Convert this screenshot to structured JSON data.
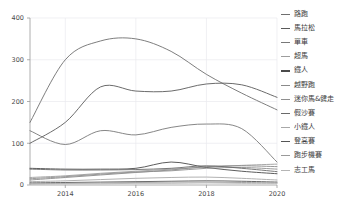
{
  "chart_data": {
    "type": "line",
    "title": "",
    "subtitle": "",
    "xlabel": "",
    "ylabel": "",
    "xlim": [
      2013,
      2020
    ],
    "ylim": [
      0,
      400
    ],
    "grid": true,
    "legend_position": "right",
    "x": [
      2013,
      2014,
      2015,
      2016,
      2017,
      2018,
      2019,
      2020
    ],
    "xticks": [
      "2014",
      "2016",
      "2018",
      "2020"
    ],
    "xtick_values": [
      2014,
      2016,
      2018,
      2020
    ],
    "yticks": [
      "0",
      "100",
      "200",
      "300",
      "400"
    ],
    "ytick_values": [
      0,
      100,
      200,
      300,
      400
    ],
    "series": [
      {
        "name": "路跑",
        "color": "#6f6f6f",
        "width": 1.0,
        "values": [
          150,
          300,
          345,
          350,
          320,
          265,
          220,
          180
        ]
      },
      {
        "name": "馬拉松",
        "color": "#5a5a5a",
        "width": 1.1,
        "values": [
          100,
          150,
          235,
          225,
          225,
          242,
          240,
          210
        ]
      },
      {
        "name": "單車",
        "color": "#787878",
        "width": 1.0,
        "values": [
          130,
          97,
          130,
          120,
          138,
          146,
          135,
          55
        ]
      },
      {
        "name": "超馬",
        "color": "#9d9d9d",
        "width": 0.8,
        "values": [
          18,
          22,
          28,
          33,
          38,
          43,
          47,
          50
        ]
      },
      {
        "name": "鐵人",
        "color": "#4a4a4a",
        "width": 1.2,
        "values": [
          40,
          38,
          38,
          40,
          55,
          42,
          33,
          27
        ]
      },
      {
        "name": "越野跑",
        "color": "#8a8a8a",
        "width": 0.9,
        "values": [
          12,
          18,
          24,
          30,
          36,
          44,
          46,
          44
        ]
      },
      {
        "name": "迷你馬&健走",
        "color": "#8f8f8f",
        "width": 0.9,
        "values": [
          15,
          20,
          26,
          31,
          34,
          40,
          42,
          38
        ]
      },
      {
        "name": "假沙賽",
        "color": "#6a6a6a",
        "width": 1.0,
        "values": [
          38,
          36,
          36,
          37,
          40,
          46,
          40,
          32
        ]
      },
      {
        "name": "小鐵人",
        "color": "#a8a8a8",
        "width": 0.8,
        "values": [
          8,
          10,
          13,
          16,
          18,
          19,
          16,
          12
        ]
      },
      {
        "name": "登高賽",
        "color": "#555555",
        "width": 1.1,
        "values": [
          5,
          6,
          7,
          8,
          9,
          10,
          9,
          7
        ]
      },
      {
        "name": "跑步機賽",
        "color": "#9a9a9a",
        "width": 0.8,
        "values": [
          3,
          4,
          5,
          6,
          7,
          7,
          6,
          5
        ]
      },
      {
        "name": "志工馬",
        "color": "#b5b5b5",
        "width": 0.8,
        "values": [
          2,
          3,
          3,
          4,
          4,
          5,
          4,
          4
        ]
      }
    ]
  }
}
